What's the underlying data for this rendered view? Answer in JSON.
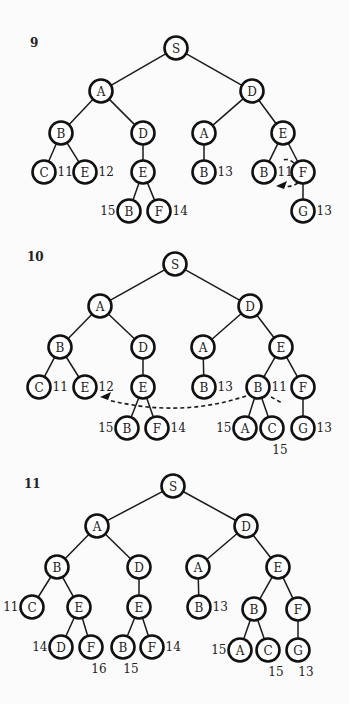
{
  "diagrams": [
    {
      "step": "9",
      "label_pos": [
        30,
        47
      ],
      "nodes": [
        {
          "id": "s",
          "label": "S",
          "x": 176,
          "y": 48
        },
        {
          "id": "a",
          "label": "A",
          "x": 101,
          "y": 91
        },
        {
          "id": "d",
          "label": "D",
          "x": 252,
          "y": 91
        },
        {
          "id": "ab",
          "label": "B",
          "x": 61,
          "y": 133
        },
        {
          "id": "ad",
          "label": "D",
          "x": 143,
          "y": 133
        },
        {
          "id": "da",
          "label": "A",
          "x": 204,
          "y": 133
        },
        {
          "id": "de",
          "label": "E",
          "x": 283,
          "y": 133
        },
        {
          "id": "abc",
          "label": "C",
          "x": 44,
          "y": 172,
          "annot": "11",
          "annot_pos": "right"
        },
        {
          "id": "abe",
          "label": "E",
          "x": 85,
          "y": 172,
          "annot": "12",
          "annot_pos": "right"
        },
        {
          "id": "ade",
          "label": "E",
          "x": 143,
          "y": 172
        },
        {
          "id": "dab",
          "label": "B",
          "x": 204,
          "y": 172,
          "annot": "13",
          "annot_pos": "right"
        },
        {
          "id": "deb",
          "label": "B",
          "x": 264,
          "y": 172,
          "annot": "11",
          "annot_pos": "right"
        },
        {
          "id": "def",
          "label": "F",
          "x": 303,
          "y": 172
        },
        {
          "id": "adeb",
          "label": "B",
          "x": 129,
          "y": 211,
          "annot": "15",
          "annot_pos": "left"
        },
        {
          "id": "adef",
          "label": "F",
          "x": 159,
          "y": 211,
          "annot": "14",
          "annot_pos": "right"
        },
        {
          "id": "defg",
          "label": "G",
          "x": 303,
          "y": 211,
          "annot": "13",
          "annot_pos": "right"
        }
      ],
      "edges": [
        [
          "s",
          "a"
        ],
        [
          "s",
          "d"
        ],
        [
          "a",
          "ab"
        ],
        [
          "a",
          "ad"
        ],
        [
          "d",
          "da"
        ],
        [
          "d",
          "de"
        ],
        [
          "ab",
          "abc"
        ],
        [
          "ab",
          "abe"
        ],
        [
          "ad",
          "ade"
        ],
        [
          "da",
          "dab"
        ],
        [
          "de",
          "deb"
        ],
        [
          "de",
          "def"
        ],
        [
          "ade",
          "adeb"
        ],
        [
          "ade",
          "adef"
        ],
        [
          "def",
          "defg"
        ]
      ],
      "arrows": [
        {
          "type": "dashed-short",
          "path": "M 294 163 Q 288 158 283 160 M 298 183 Q 290 188 281 186",
          "head": [
            276,
            186
          ],
          "head_dir": "left"
        }
      ]
    },
    {
      "step": "10",
      "label_pos": [
        27,
        261
      ],
      "nodes": [
        {
          "id": "s",
          "label": "S",
          "x": 175,
          "y": 264
        },
        {
          "id": "a",
          "label": "A",
          "x": 100,
          "y": 306
        },
        {
          "id": "d",
          "label": "D",
          "x": 250,
          "y": 306
        },
        {
          "id": "ab",
          "label": "B",
          "x": 60,
          "y": 347
        },
        {
          "id": "ad",
          "label": "D",
          "x": 143,
          "y": 347
        },
        {
          "id": "da",
          "label": "A",
          "x": 203,
          "y": 347
        },
        {
          "id": "de",
          "label": "E",
          "x": 281,
          "y": 347
        },
        {
          "id": "abc",
          "label": "C",
          "x": 39,
          "y": 387,
          "annot": "11",
          "annot_pos": "right"
        },
        {
          "id": "abe",
          "label": "E",
          "x": 85,
          "y": 387,
          "annot": "12",
          "annot_pos": "right"
        },
        {
          "id": "ade",
          "label": "E",
          "x": 143,
          "y": 387
        },
        {
          "id": "dab",
          "label": "B",
          "x": 204,
          "y": 387,
          "annot": "13",
          "annot_pos": "right"
        },
        {
          "id": "deb",
          "label": "B",
          "x": 258,
          "y": 387,
          "annot": "11",
          "annot_pos": "right"
        },
        {
          "id": "def",
          "label": "F",
          "x": 303,
          "y": 387
        },
        {
          "id": "adeb",
          "label": "B",
          "x": 127,
          "y": 428,
          "annot": "15",
          "annot_pos": "left"
        },
        {
          "id": "adef",
          "label": "F",
          "x": 157,
          "y": 428,
          "annot": "14",
          "annot_pos": "right"
        },
        {
          "id": "deba",
          "label": "A",
          "x": 245,
          "y": 428,
          "annot": "15",
          "annot_pos": "left"
        },
        {
          "id": "debc",
          "label": "C",
          "x": 272,
          "y": 428,
          "annot": "15",
          "annot_pos": "below"
        },
        {
          "id": "defg",
          "label": "G",
          "x": 303,
          "y": 428,
          "annot": "13",
          "annot_pos": "right"
        }
      ],
      "edges": [
        [
          "s",
          "a"
        ],
        [
          "s",
          "d"
        ],
        [
          "a",
          "ab"
        ],
        [
          "a",
          "ad"
        ],
        [
          "d",
          "da"
        ],
        [
          "d",
          "de"
        ],
        [
          "ab",
          "abc"
        ],
        [
          "ab",
          "abe"
        ],
        [
          "ad",
          "ade"
        ],
        [
          "da",
          "dab"
        ],
        [
          "de",
          "deb"
        ],
        [
          "de",
          "def"
        ],
        [
          "ade",
          "adeb"
        ],
        [
          "ade",
          "adef"
        ],
        [
          "deb",
          "deba"
        ],
        [
          "deb",
          "debc"
        ],
        [
          "def",
          "defg"
        ]
      ],
      "arrows": [
        {
          "type": "dashed-long",
          "path": "M 246 396 Q 180 418 108 400",
          "head": [
            100,
            397
          ],
          "head_dir": "left"
        },
        {
          "type": "dashed-stub",
          "path": "M 271 397 L 282 403"
        }
      ]
    },
    {
      "step": "11",
      "label_pos": [
        24,
        488
      ],
      "nodes": [
        {
          "id": "s",
          "label": "S",
          "x": 173,
          "y": 486
        },
        {
          "id": "a",
          "label": "A",
          "x": 97,
          "y": 526
        },
        {
          "id": "d",
          "label": "D",
          "x": 246,
          "y": 526
        },
        {
          "id": "ab",
          "label": "B",
          "x": 57,
          "y": 567
        },
        {
          "id": "ad",
          "label": "D",
          "x": 139,
          "y": 567
        },
        {
          "id": "da",
          "label": "A",
          "x": 198,
          "y": 567
        },
        {
          "id": "de",
          "label": "E",
          "x": 278,
          "y": 567
        },
        {
          "id": "abc",
          "label": "C",
          "x": 32,
          "y": 607,
          "annot": "11",
          "annot_pos": "left"
        },
        {
          "id": "abe",
          "label": "E",
          "x": 79,
          "y": 607
        },
        {
          "id": "ade",
          "label": "E",
          "x": 139,
          "y": 607
        },
        {
          "id": "dab",
          "label": "B",
          "x": 199,
          "y": 607,
          "annot": "13",
          "annot_pos": "right"
        },
        {
          "id": "deb",
          "label": "B",
          "x": 254,
          "y": 609
        },
        {
          "id": "def",
          "label": "F",
          "x": 298,
          "y": 609
        },
        {
          "id": "abed",
          "label": "D",
          "x": 61,
          "y": 647,
          "annot": "14",
          "annot_pos": "left"
        },
        {
          "id": "abef",
          "label": "F",
          "x": 91,
          "y": 647,
          "annot": "16",
          "annot_pos": "below"
        },
        {
          "id": "adeb",
          "label": "B",
          "x": 123,
          "y": 647,
          "annot": "15",
          "annot_pos": "below"
        },
        {
          "id": "adef",
          "label": "F",
          "x": 152,
          "y": 647,
          "annot": "14",
          "annot_pos": "right"
        },
        {
          "id": "deba",
          "label": "A",
          "x": 240,
          "y": 650,
          "annot": "15",
          "annot_pos": "left"
        },
        {
          "id": "debc",
          "label": "C",
          "x": 268,
          "y": 650,
          "annot": "15",
          "annot_pos": "below"
        },
        {
          "id": "defg",
          "label": "G",
          "x": 298,
          "y": 650,
          "annot": "13",
          "annot_pos": "below"
        }
      ],
      "edges": [
        [
          "s",
          "a"
        ],
        [
          "s",
          "d"
        ],
        [
          "a",
          "ab"
        ],
        [
          "a",
          "ad"
        ],
        [
          "d",
          "da"
        ],
        [
          "d",
          "de"
        ],
        [
          "ab",
          "abc"
        ],
        [
          "ab",
          "abe"
        ],
        [
          "ad",
          "ade"
        ],
        [
          "da",
          "dab"
        ],
        [
          "de",
          "deb"
        ],
        [
          "de",
          "def"
        ],
        [
          "abe",
          "abed"
        ],
        [
          "abe",
          "abef"
        ],
        [
          "ade",
          "adeb"
        ],
        [
          "ade",
          "adef"
        ],
        [
          "deb",
          "deba"
        ],
        [
          "deb",
          "debc"
        ],
        [
          "def",
          "defg"
        ]
      ],
      "arrows": []
    }
  ],
  "style": {
    "node_radius": 11.5,
    "stroke_color": "#111111",
    "background": "#fbfbfb"
  }
}
